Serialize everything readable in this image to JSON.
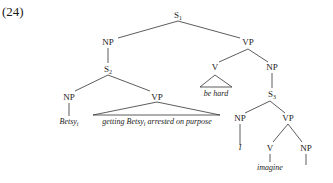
{
  "example_number": "(24)",
  "tree": {
    "s1": {
      "label": "S",
      "sub": "1"
    },
    "np_top": {
      "label": "NP"
    },
    "vp_top": {
      "label": "VP"
    },
    "s2": {
      "label": "S",
      "sub": "2"
    },
    "v_behard": {
      "label": "V"
    },
    "behard_text": "be hard",
    "np_right": {
      "label": "NP"
    },
    "s3": {
      "label": "S",
      "sub": "3"
    },
    "np_betsy": {
      "label": "NP"
    },
    "betsy_text": {
      "label": "Betsy",
      "sub": "i"
    },
    "vp_getting": {
      "label": "VP"
    },
    "getting_text": {
      "pre": "getting Betsy",
      "sub": "i",
      "post": " arrested on purpose"
    },
    "np_i": {
      "label": "NP"
    },
    "i_text": "I",
    "vp_imagine": {
      "label": "VP"
    },
    "v_imagine": {
      "label": "V"
    },
    "imagine_text": "imagine",
    "np_obj": {
      "label": "NP"
    }
  }
}
